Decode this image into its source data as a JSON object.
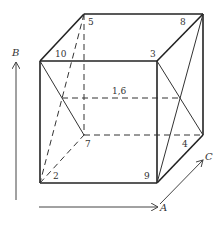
{
  "diagram": {
    "type": "cube-with-diagonals",
    "colors": {
      "stroke": "#222222",
      "thin": "#444444",
      "text": "#333333"
    },
    "vertex_labels": [
      {
        "id": "v5",
        "text": "5",
        "x": 88,
        "y": 25
      },
      {
        "id": "v8",
        "text": "8",
        "x": 180,
        "y": 25
      },
      {
        "id": "v10",
        "text": "10",
        "x": 55,
        "y": 56
      },
      {
        "id": "v3",
        "text": "3",
        "x": 150,
        "y": 56
      },
      {
        "id": "v16",
        "text": "1,6",
        "x": 112,
        "y": 92
      },
      {
        "id": "v7",
        "text": "7",
        "x": 85,
        "y": 146
      },
      {
        "id": "v4",
        "text": "4",
        "x": 182,
        "y": 146
      },
      {
        "id": "v2",
        "text": "2",
        "x": 53,
        "y": 178
      },
      {
        "id": "v9",
        "text": "9",
        "x": 144,
        "y": 178
      }
    ],
    "axes": {
      "A": "A",
      "B": "B",
      "C": "C"
    }
  }
}
